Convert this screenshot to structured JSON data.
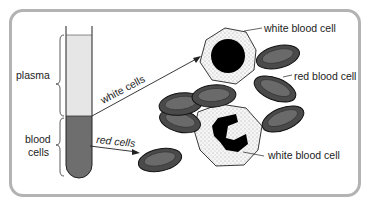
{
  "diagram": {
    "test_tube": {
      "labels": {
        "plasma": "plasma",
        "blood_cells_line1": "blood",
        "blood_cells_line2": "cells"
      },
      "colors": {
        "plasma": "#e6e6e6",
        "blood_cells": "#6e6e6e",
        "outline": "#222222"
      }
    },
    "arrows": {
      "white_cells": "white cells",
      "red_cells": "red cells"
    },
    "callouts": {
      "white_blood_cell_top": "white blood cell",
      "red_blood_cell": "red blood cell",
      "white_blood_cell_bottom": "white blood cell"
    },
    "colors": {
      "frame_border": "#b3b3b3",
      "red_cell_fill": "#5a5a5a",
      "red_cell_inner": "#777777",
      "white_cell_fill": "#f4f4f4",
      "nucleus": "#000000"
    }
  }
}
